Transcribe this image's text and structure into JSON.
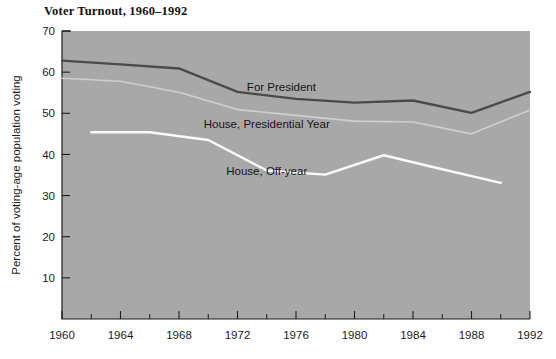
{
  "chart_data": {
    "type": "line",
    "title": "Voter Turnout, 1960–1992",
    "xlabel": "",
    "ylabel": "Percent of voting-age population voting",
    "xlim": [
      1960,
      1992
    ],
    "ylim": [
      0,
      70
    ],
    "grid": false,
    "legend_position": "inline-annotations",
    "x_ticks": [
      1960,
      1964,
      1968,
      1972,
      1976,
      1980,
      1984,
      1988,
      1992
    ],
    "x_tick_labels": [
      "1960",
      "1964",
      "1968",
      "1972",
      "1976",
      "1980",
      "1984",
      "1988",
      "1992"
    ],
    "x_minor_ticks": [
      1962,
      1966,
      1970,
      1974,
      1978,
      1982,
      1986,
      1990
    ],
    "y_ticks": [
      10,
      20,
      30,
      40,
      50,
      60,
      70
    ],
    "y_tick_labels": [
      "10",
      "20",
      "30",
      "40",
      "50",
      "60",
      "70"
    ],
    "plot_background_color": "#a8a8a8",
    "series": [
      {
        "name": "For President",
        "color": "#4a4a4a",
        "width": 2.4,
        "label_x": 1975,
        "label_y": 55.5,
        "x": [
          1960,
          1964,
          1968,
          1972,
          1976,
          1980,
          1984,
          1988,
          1992
        ],
        "values": [
          62.8,
          61.9,
          60.9,
          55.2,
          53.5,
          52.6,
          53.1,
          50.1,
          55.2
        ]
      },
      {
        "name": "House, Presidential Year",
        "color": "#cfcfcf",
        "width": 1.6,
        "label_x": 1974,
        "label_y": 46.5,
        "x": [
          1960,
          1964,
          1968,
          1972,
          1976,
          1980,
          1984,
          1988,
          1992
        ],
        "values": [
          58.5,
          57.8,
          55.1,
          50.9,
          49.5,
          48.1,
          47.9,
          45.0,
          50.8
        ]
      },
      {
        "name": "House, Off-year",
        "color": "#fafafa",
        "width": 2.4,
        "label_x": 1974,
        "label_y": 35.0,
        "x": [
          1962,
          1966,
          1970,
          1974,
          1978,
          1982,
          1986,
          1990
        ],
        "values": [
          45.4,
          45.4,
          43.5,
          36.1,
          35.1,
          39.8,
          36.4,
          33.1
        ]
      }
    ]
  }
}
